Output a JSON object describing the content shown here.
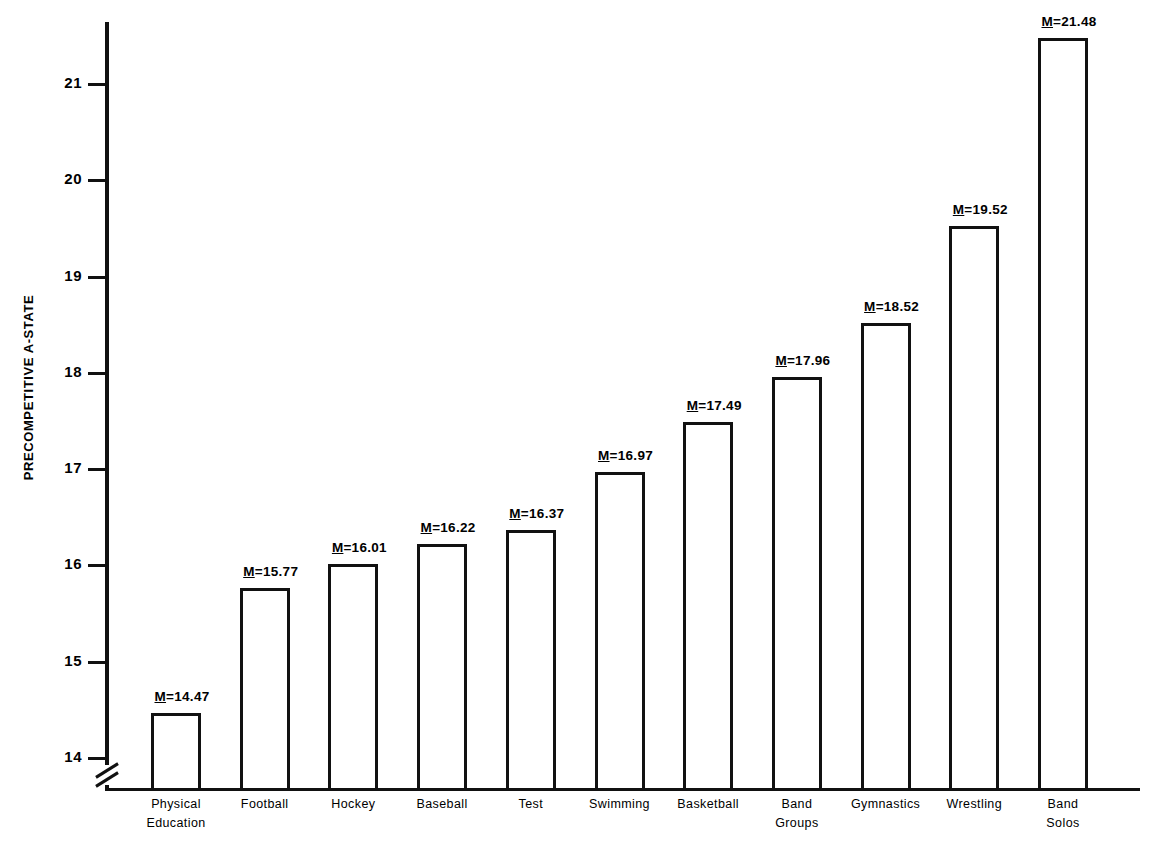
{
  "chart_data": {
    "type": "bar",
    "title": "",
    "xlabel": "",
    "ylabel": "PRECOMPETITIVE A-STATE",
    "ylim": [
      14,
      21.7
    ],
    "yticks": [
      14,
      15,
      16,
      17,
      18,
      19,
      20,
      21
    ],
    "ytick_labels": [
      "14",
      "15",
      "16",
      "17",
      "18",
      "19",
      "20",
      "21"
    ],
    "axis_break": true,
    "grid": false,
    "legend": null,
    "bar_style": "outline",
    "value_label_prefix": "M",
    "categories": [
      "Physical\nEducation",
      "Football",
      "Hockey",
      "Baseball",
      "Test",
      "Swimming",
      "Basketball",
      "Band\nGroups",
      "Gymnastics",
      "Wrestling",
      "Band\nSolos"
    ],
    "values": [
      14.47,
      15.77,
      16.01,
      16.22,
      16.37,
      16.97,
      17.49,
      17.96,
      18.52,
      19.52,
      21.48
    ],
    "value_labels": [
      "M=14.47",
      "M=15.77",
      "M=16.01",
      "M=16.22",
      "M=16.37",
      "M=16.97",
      "M=17.49",
      "M=17.96",
      "M=18.52",
      "M=19.52",
      "M=21.48"
    ]
  },
  "colors": {
    "ink": "#111111",
    "background": "#ffffff"
  }
}
